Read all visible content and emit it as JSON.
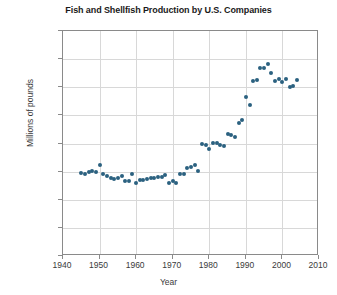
{
  "chart_data": {
    "type": "scatter",
    "title": "Fish and Shellfish Production by U.S. Companies",
    "xlabel": "Year",
    "ylabel": "Millions of pounds",
    "xlim": [
      1940,
      2010
    ],
    "ylim": [
      0,
      4000
    ],
    "xticks": [
      1940,
      1950,
      1960,
      1970,
      1980,
      1990,
      2000,
      2010
    ],
    "yticks": [
      0,
      500,
      1000,
      1500,
      2000,
      2500,
      3000,
      3500,
      4000
    ],
    "grid": true,
    "legend": null,
    "marker_color": "#2b6180",
    "series": [
      {
        "name": "Fish and shellfish production",
        "x": [
          1945,
          1946,
          1947,
          1948,
          1949,
          1950,
          1951,
          1952,
          1953,
          1954,
          1955,
          1956,
          1957,
          1958,
          1959,
          1960,
          1961,
          1962,
          1963,
          1964,
          1965,
          1966,
          1967,
          1968,
          1969,
          1970,
          1971,
          1972,
          1973,
          1974,
          1975,
          1976,
          1977,
          1978,
          1979,
          1980,
          1981,
          1982,
          1983,
          1984,
          1985,
          1986,
          1987,
          1988,
          1989,
          1990,
          1991,
          1992,
          1993,
          1994,
          1995,
          1996,
          1997,
          1998,
          1999,
          2000,
          2001,
          2002,
          2003,
          2004
        ],
        "y": [
          1470,
          1455,
          1490,
          1510,
          1500,
          1610,
          1450,
          1430,
          1390,
          1370,
          1390,
          1420,
          1330,
          1340,
          1450,
          1300,
          1350,
          1355,
          1370,
          1390,
          1395,
          1400,
          1410,
          1440,
          1300,
          1330,
          1290,
          1450,
          1460,
          1560,
          1590,
          1620,
          1520,
          1990,
          1970,
          1900,
          2010,
          2010,
          1970,
          1950,
          2170,
          2160,
          2120,
          2360,
          2420,
          2830,
          2680,
          3110,
          3130,
          3350,
          3340,
          3420,
          3250,
          3110,
          3140,
          3090,
          3150,
          3010,
          3020,
          3130
        ]
      }
    ]
  },
  "axis_text": {
    "y_0": "0",
    "y_500": "500",
    "y_1000": "1000",
    "y_1500": "1500",
    "y_2000": "2000",
    "y_2500": "2500",
    "y_3000": "3000",
    "y_3500": "3500",
    "y_4000": "4000",
    "x_1940": "1940",
    "x_1950": "1950",
    "x_1960": "1960",
    "x_1970": "1970",
    "x_1980": "1980",
    "x_1990": "1990",
    "x_2000": "2000",
    "x_2010": "2010"
  }
}
